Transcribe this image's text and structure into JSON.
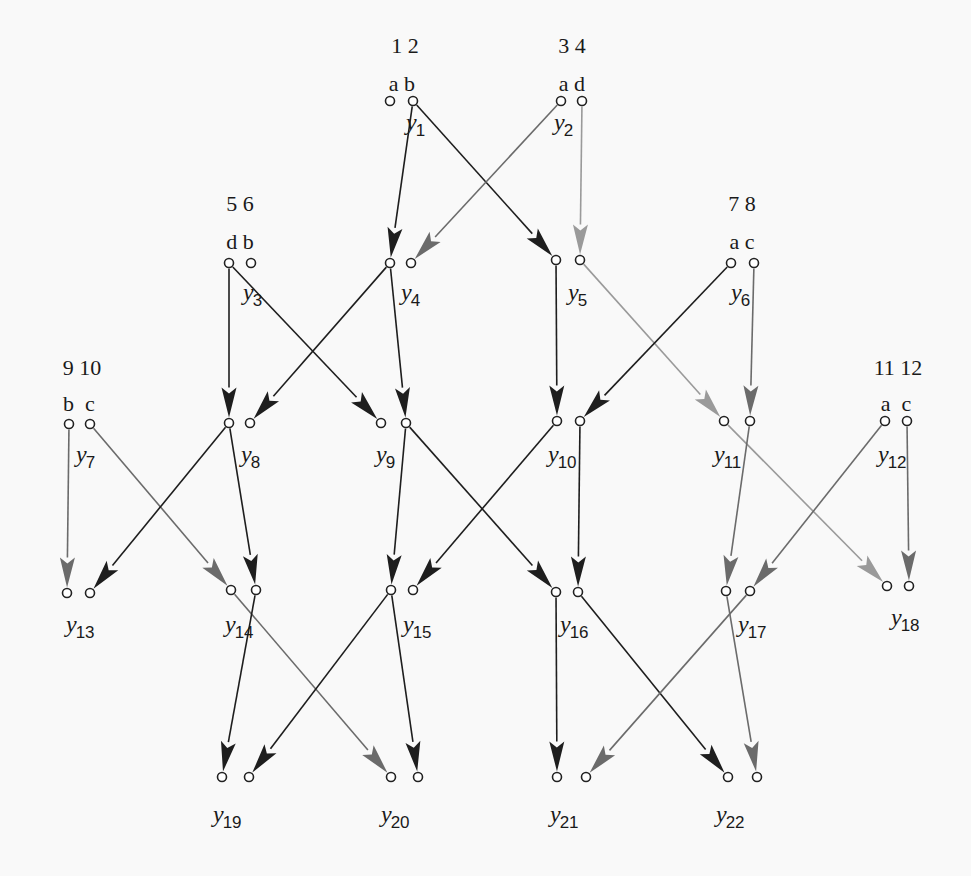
{
  "diagram": {
    "title": "",
    "colors": {
      "background": "#f9f9f9",
      "dark": "#1e1e1e",
      "mid": "#6b6b6b",
      "light": "#9a9a9a",
      "node_stroke": "#222222"
    },
    "inputs": [
      {
        "id": "in12",
        "numbers": "1 2",
        "letters": "a b",
        "numbers_pos": [
          405,
          53
        ],
        "letters_pos": [
          402,
          91
        ],
        "unit": "y1"
      },
      {
        "id": "in34",
        "numbers": "3 4",
        "letters": "a d",
        "numbers_pos": [
          572,
          53
        ],
        "letters_pos": [
          572,
          91
        ],
        "unit": "y2"
      },
      {
        "id": "in56",
        "numbers": "5 6",
        "letters": "d b",
        "numbers_pos": [
          240,
          211
        ],
        "letters_pos": [
          240,
          249
        ],
        "unit": "y3"
      },
      {
        "id": "in78",
        "numbers": "7 8",
        "letters": "a c",
        "numbers_pos": [
          742,
          211
        ],
        "letters_pos": [
          742,
          249
        ],
        "unit": "y6"
      },
      {
        "id": "in910",
        "numbers": "9 10",
        "letters": "b  c",
        "numbers_pos": [
          82,
          375
        ],
        "letters_pos": [
          79,
          411
        ],
        "unit": "y7"
      },
      {
        "id": "in1112",
        "numbers": "11 12",
        "letters": "a  c",
        "numbers_pos": [
          898,
          375
        ],
        "letters_pos": [
          896,
          411
        ],
        "unit": "y12"
      }
    ],
    "units": [
      {
        "name": "y1",
        "sub": "1",
        "left": [
          390,
          101
        ],
        "right": [
          413,
          101
        ],
        "label": [
          406,
          130
        ]
      },
      {
        "name": "y2",
        "sub": "2",
        "left": [
          561,
          101
        ],
        "right": [
          582,
          101
        ],
        "label": [
          554,
          130
        ]
      },
      {
        "name": "y3",
        "sub": "3",
        "left": [
          229,
          263
        ],
        "right": [
          251,
          263
        ],
        "label": [
          243,
          300
        ]
      },
      {
        "name": "y4",
        "sub": "4",
        "left": [
          390,
          263
        ],
        "right": [
          411,
          263
        ],
        "label": [
          401,
          300
        ]
      },
      {
        "name": "y5",
        "sub": "5",
        "left": [
          556,
          260
        ],
        "right": [
          580,
          260
        ],
        "label": [
          568,
          300
        ]
      },
      {
        "name": "y6",
        "sub": "6",
        "left": [
          731,
          263
        ],
        "right": [
          754,
          263
        ],
        "label": [
          731,
          300
        ]
      },
      {
        "name": "y7",
        "sub": "7",
        "left": [
          69,
          424
        ],
        "right": [
          90,
          424
        ],
        "label": [
          76,
          462
        ]
      },
      {
        "name": "y8",
        "sub": "8",
        "left": [
          229,
          423
        ],
        "right": [
          250,
          423
        ],
        "label": [
          241,
          462
        ]
      },
      {
        "name": "y9",
        "sub": "9",
        "left": [
          381,
          423
        ],
        "right": [
          406,
          423
        ],
        "label": [
          376,
          462
        ]
      },
      {
        "name": "y10",
        "sub": "10",
        "left": [
          557,
          421
        ],
        "right": [
          580,
          421
        ],
        "label": [
          548,
          462
        ]
      },
      {
        "name": "y11",
        "sub": "11",
        "left": [
          724,
          421
        ],
        "right": [
          750,
          421
        ],
        "label": [
          714,
          462
        ]
      },
      {
        "name": "y12",
        "sub": "12",
        "left": [
          885,
          421
        ],
        "right": [
          907,
          421
        ],
        "label": [
          878,
          462
        ]
      },
      {
        "name": "y13",
        "sub": "13",
        "left": [
          67,
          593
        ],
        "right": [
          90,
          593
        ],
        "label": [
          66,
          632
        ]
      },
      {
        "name": "y14",
        "sub": "14",
        "left": [
          231,
          590
        ],
        "right": [
          256,
          590
        ],
        "label": [
          225,
          632
        ]
      },
      {
        "name": "y15",
        "sub": "15",
        "left": [
          391,
          590
        ],
        "right": [
          413,
          590
        ],
        "label": [
          403,
          632
        ]
      },
      {
        "name": "y16",
        "sub": "16",
        "left": [
          556,
          592
        ],
        "right": [
          578,
          592
        ],
        "label": [
          560,
          632
        ]
      },
      {
        "name": "y17",
        "sub": "17",
        "left": [
          726,
          591
        ],
        "right": [
          750,
          591
        ],
        "label": [
          738,
          632
        ]
      },
      {
        "name": "y18",
        "sub": "18",
        "left": [
          887,
          586
        ],
        "right": [
          909,
          586
        ],
        "label": [
          891,
          625
        ]
      },
      {
        "name": "y19",
        "sub": "19",
        "left": [
          222,
          777
        ],
        "right": [
          249,
          777
        ],
        "label": [
          213,
          822
        ]
      },
      {
        "name": "y20",
        "sub": "20",
        "left": [
          391,
          777
        ],
        "right": [
          418,
          777
        ],
        "label": [
          381,
          822
        ]
      },
      {
        "name": "y21",
        "sub": "21",
        "left": [
          557,
          777
        ],
        "right": [
          586,
          777
        ],
        "label": [
          550,
          822
        ]
      },
      {
        "name": "y22",
        "sub": "22",
        "left": [
          728,
          777
        ],
        "right": [
          757,
          777
        ],
        "label": [
          716,
          822
        ]
      }
    ],
    "edges": [
      {
        "from": "y1.right",
        "to": "y4.left",
        "shade": "dark"
      },
      {
        "from": "y1.right",
        "to": "y5.left",
        "shade": "dark"
      },
      {
        "from": "y2.left",
        "to": "y4.right",
        "shade": "mid"
      },
      {
        "from": "y2.right",
        "to": "y5.right",
        "shade": "light"
      },
      {
        "from": "y3.left",
        "to": "y8.left",
        "shade": "dark"
      },
      {
        "from": "y3.left",
        "to": "y9.left",
        "shade": "dark"
      },
      {
        "from": "y4.left",
        "to": "y8.right",
        "shade": "dark"
      },
      {
        "from": "y4.left",
        "to": "y9.right",
        "shade": "dark"
      },
      {
        "from": "y5.left",
        "to": "y10.left",
        "shade": "dark"
      },
      {
        "from": "y5.right",
        "to": "y11.left",
        "shade": "light"
      },
      {
        "from": "y6.left",
        "to": "y10.right",
        "shade": "dark"
      },
      {
        "from": "y6.right",
        "to": "y11.right",
        "shade": "mid"
      },
      {
        "from": "y7.left",
        "to": "y13.left",
        "shade": "mid"
      },
      {
        "from": "y7.right",
        "to": "y14.left",
        "shade": "mid"
      },
      {
        "from": "y8.left",
        "to": "y13.right",
        "shade": "dark"
      },
      {
        "from": "y8.left",
        "to": "y14.right",
        "shade": "dark"
      },
      {
        "from": "y9.right",
        "to": "y15.left",
        "shade": "dark"
      },
      {
        "from": "y9.right",
        "to": "y16.left",
        "shade": "dark"
      },
      {
        "from": "y10.left",
        "to": "y15.right",
        "shade": "dark"
      },
      {
        "from": "y10.right",
        "to": "y16.right",
        "shade": "dark"
      },
      {
        "from": "y11.left",
        "to": "y18.left",
        "shade": "light"
      },
      {
        "from": "y11.right",
        "to": "y17.left",
        "shade": "mid"
      },
      {
        "from": "y12.left",
        "to": "y17.right",
        "shade": "mid"
      },
      {
        "from": "y12.right",
        "to": "y18.right",
        "shade": "mid"
      },
      {
        "from": "y14.left",
        "to": "y20.left",
        "shade": "mid"
      },
      {
        "from": "y14.right",
        "to": "y19.left",
        "shade": "dark"
      },
      {
        "from": "y15.left",
        "to": "y19.right",
        "shade": "dark"
      },
      {
        "from": "y15.left",
        "to": "y20.right",
        "shade": "dark"
      },
      {
        "from": "y16.left",
        "to": "y21.left",
        "shade": "dark"
      },
      {
        "from": "y16.right",
        "to": "y22.left",
        "shade": "dark"
      },
      {
        "from": "y17.left",
        "to": "y22.right",
        "shade": "mid"
      },
      {
        "from": "y17.right",
        "to": "y21.right",
        "shade": "mid"
      }
    ]
  }
}
